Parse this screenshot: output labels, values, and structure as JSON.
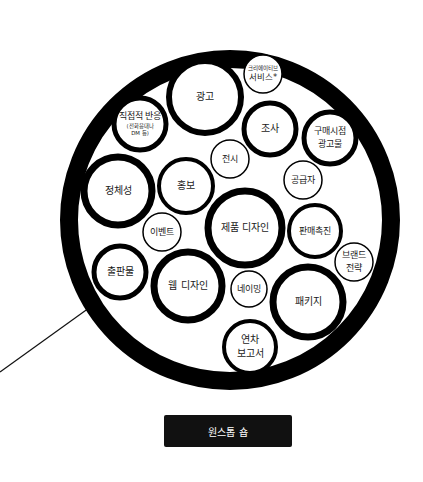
{
  "diagram": {
    "outer_circle": {
      "cx": 230,
      "cy": 220,
      "r": 161,
      "stroke": 18,
      "color": "#000000"
    },
    "pointer_line": {
      "x1": 0,
      "y1": 372,
      "x2": 89,
      "y2": 308
    },
    "bubbles": [
      {
        "id": "advertising",
        "lines": [
          "광고"
        ],
        "cx": 205,
        "cy": 97,
        "r": 36,
        "stroke": 6,
        "font": 10
      },
      {
        "id": "creative-services",
        "lines": [
          "크리에이티브",
          "서비스*"
        ],
        "cx": 263,
        "cy": 74,
        "r": 19,
        "stroke": 1.5,
        "font": 6.5,
        "small_first": true
      },
      {
        "id": "direct-response",
        "lines": [
          "직접적 반응",
          "(전화응대나",
          "DM 등)"
        ],
        "cx": 140,
        "cy": 124,
        "r": 26,
        "stroke": 5,
        "font": 9,
        "small_rest": true
      },
      {
        "id": "research",
        "lines": [
          "조사"
        ],
        "cx": 270,
        "cy": 129,
        "r": 26,
        "stroke": 5,
        "font": 10
      },
      {
        "id": "point-of-purchase",
        "lines": [
          "구매시점",
          "광고물"
        ],
        "cx": 330,
        "cy": 138,
        "r": 26,
        "stroke": 5,
        "font": 9
      },
      {
        "id": "exhibition",
        "lines": [
          "전시"
        ],
        "cx": 230,
        "cy": 159,
        "r": 19,
        "stroke": 1.5,
        "font": 9
      },
      {
        "id": "supplier",
        "lines": [
          "공급자"
        ],
        "cx": 303,
        "cy": 180,
        "r": 19,
        "stroke": 1.5,
        "font": 9
      },
      {
        "id": "identity",
        "lines": [
          "정체성"
        ],
        "cx": 118,
        "cy": 191,
        "r": 34,
        "stroke": 7,
        "font": 10
      },
      {
        "id": "public-relations",
        "lines": [
          "홍보"
        ],
        "cx": 186,
        "cy": 186,
        "r": 27,
        "stroke": 4,
        "font": 10
      },
      {
        "id": "events",
        "lines": [
          "이벤트"
        ],
        "cx": 162,
        "cy": 232,
        "r": 19,
        "stroke": 1.5,
        "font": 9
      },
      {
        "id": "product-design",
        "lines": [
          "제품 디자인"
        ],
        "cx": 245,
        "cy": 228,
        "r": 37,
        "stroke": 7,
        "font": 10
      },
      {
        "id": "sales-promotion",
        "lines": [
          "판매촉진"
        ],
        "cx": 315,
        "cy": 231,
        "r": 26,
        "stroke": 4,
        "font": 9
      },
      {
        "id": "brand-strategy",
        "lines": [
          "브랜드",
          "전략"
        ],
        "cx": 354,
        "cy": 262,
        "r": 19,
        "stroke": 1.5,
        "font": 9
      },
      {
        "id": "publications",
        "lines": [
          "출판물"
        ],
        "cx": 120,
        "cy": 272,
        "r": 26,
        "stroke": 5,
        "font": 10
      },
      {
        "id": "web-design",
        "lines": [
          "웹 디자인"
        ],
        "cx": 188,
        "cy": 286,
        "r": 34,
        "stroke": 7,
        "font": 10
      },
      {
        "id": "naming",
        "lines": [
          "네이밍"
        ],
        "cx": 249,
        "cy": 289,
        "r": 18,
        "stroke": 1.5,
        "font": 9
      },
      {
        "id": "packaging",
        "lines": [
          "패키지"
        ],
        "cx": 308,
        "cy": 302,
        "r": 35,
        "stroke": 7,
        "font": 10
      },
      {
        "id": "annual-report",
        "lines": [
          "연차",
          "보고서"
        ],
        "cx": 250,
        "cy": 347,
        "r": 26,
        "stroke": 4,
        "font": 10
      }
    ]
  },
  "button": {
    "label": "원스톱 숍",
    "background": "#111111",
    "text_color": "#ffffff"
  }
}
